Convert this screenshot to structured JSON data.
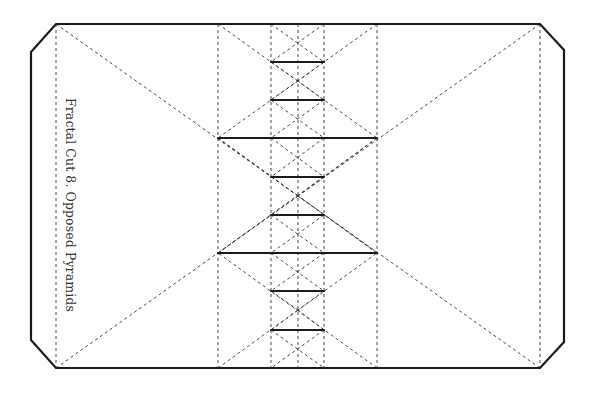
{
  "diagram": {
    "title": "Fractal Cut 8. Opposed Pyramids",
    "colors": {
      "background": "#ffffff",
      "cut_line": "#1a1a1a",
      "fold_line": "#333333"
    },
    "outline": {
      "points": [
        [
          31,
          52
        ],
        [
          56,
          24
        ],
        [
          540,
          24
        ],
        [
          564,
          50
        ],
        [
          564,
          342
        ],
        [
          540,
          368
        ],
        [
          56,
          368
        ],
        [
          31,
          340
        ]
      ]
    },
    "fold_lines": [
      {
        "x1": 56,
        "y1": 24,
        "x2": 56,
        "y2": 368
      },
      {
        "x1": 540,
        "y1": 24,
        "x2": 540,
        "y2": 368
      },
      {
        "x1": 218,
        "y1": 24,
        "x2": 218,
        "y2": 368
      },
      {
        "x1": 377,
        "y1": 24,
        "x2": 377,
        "y2": 368
      },
      {
        "x1": 271,
        "y1": 24,
        "x2": 271,
        "y2": 368
      },
      {
        "x1": 324,
        "y1": 24,
        "x2": 324,
        "y2": 368
      },
      {
        "x1": 298,
        "y1": 24,
        "x2": 298,
        "y2": 368
      },
      {
        "x1": 56,
        "y1": 24,
        "x2": 298,
        "y2": 196
      },
      {
        "x1": 540,
        "y1": 24,
        "x2": 298,
        "y2": 196
      },
      {
        "x1": 56,
        "y1": 368,
        "x2": 298,
        "y2": 196
      },
      {
        "x1": 540,
        "y1": 368,
        "x2": 298,
        "y2": 196
      },
      {
        "x1": 218,
        "y1": 24,
        "x2": 377,
        "y2": 138
      },
      {
        "x1": 377,
        "y1": 24,
        "x2": 218,
        "y2": 138
      },
      {
        "x1": 218,
        "y1": 368,
        "x2": 377,
        "y2": 253
      },
      {
        "x1": 377,
        "y1": 368,
        "x2": 218,
        "y2": 253
      },
      {
        "x1": 218,
        "y1": 138,
        "x2": 298,
        "y2": 196
      },
      {
        "x1": 377,
        "y1": 138,
        "x2": 298,
        "y2": 196
      },
      {
        "x1": 218,
        "y1": 253,
        "x2": 298,
        "y2": 196
      },
      {
        "x1": 377,
        "y1": 253,
        "x2": 298,
        "y2": 196
      },
      {
        "x1": 218,
        "y1": 138,
        "x2": 377,
        "y2": 253
      },
      {
        "x1": 377,
        "y1": 138,
        "x2": 218,
        "y2": 253
      },
      {
        "x1": 271,
        "y1": 24,
        "x2": 324,
        "y2": 62
      },
      {
        "x1": 324,
        "y1": 24,
        "x2": 271,
        "y2": 62
      },
      {
        "x1": 271,
        "y1": 100,
        "x2": 324,
        "y2": 138
      },
      {
        "x1": 324,
        "y1": 100,
        "x2": 271,
        "y2": 138
      },
      {
        "x1": 271,
        "y1": 62,
        "x2": 298,
        "y2": 81
      },
      {
        "x1": 324,
        "y1": 62,
        "x2": 298,
        "y2": 81
      },
      {
        "x1": 271,
        "y1": 100,
        "x2": 298,
        "y2": 81
      },
      {
        "x1": 324,
        "y1": 100,
        "x2": 298,
        "y2": 81
      },
      {
        "x1": 271,
        "y1": 330,
        "x2": 324,
        "y2": 368
      },
      {
        "x1": 324,
        "y1": 330,
        "x2": 271,
        "y2": 368
      },
      {
        "x1": 271,
        "y1": 253,
        "x2": 324,
        "y2": 291
      },
      {
        "x1": 324,
        "y1": 253,
        "x2": 271,
        "y2": 291
      },
      {
        "x1": 271,
        "y1": 291,
        "x2": 298,
        "y2": 310
      },
      {
        "x1": 324,
        "y1": 291,
        "x2": 298,
        "y2": 310
      },
      {
        "x1": 271,
        "y1": 330,
        "x2": 298,
        "y2": 310
      },
      {
        "x1": 324,
        "y1": 330,
        "x2": 298,
        "y2": 310
      },
      {
        "x1": 271,
        "y1": 138,
        "x2": 324,
        "y2": 177
      },
      {
        "x1": 324,
        "y1": 138,
        "x2": 271,
        "y2": 177
      },
      {
        "x1": 271,
        "y1": 215,
        "x2": 324,
        "y2": 253
      },
      {
        "x1": 324,
        "y1": 215,
        "x2": 271,
        "y2": 253
      }
    ],
    "cut_lines": [
      {
        "x1": 271,
        "y1": 62,
        "x2": 324,
        "y2": 62
      },
      {
        "x1": 271,
        "y1": 100,
        "x2": 324,
        "y2": 100
      },
      {
        "x1": 218,
        "y1": 138,
        "x2": 377,
        "y2": 138
      },
      {
        "x1": 271,
        "y1": 177,
        "x2": 324,
        "y2": 177
      },
      {
        "x1": 271,
        "y1": 215,
        "x2": 324,
        "y2": 215
      },
      {
        "x1": 218,
        "y1": 253,
        "x2": 377,
        "y2": 253
      },
      {
        "x1": 271,
        "y1": 291,
        "x2": 324,
        "y2": 291
      },
      {
        "x1": 271,
        "y1": 330,
        "x2": 324,
        "y2": 330
      }
    ]
  }
}
